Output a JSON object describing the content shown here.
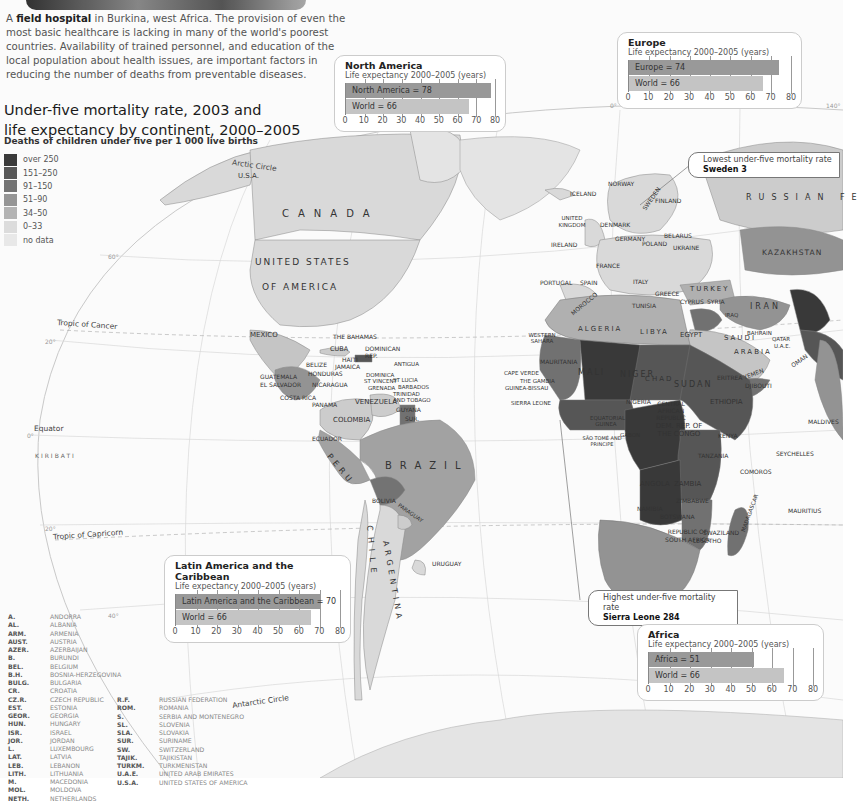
{
  "caption": {
    "bold": "field hospital",
    "prefix": "A ",
    "rest": " in Burkina, west Africa. The provision of even the most basic healthcare is lacking in many of the world's poorest countries. Availability of trained personnel, and education of the local population about health issues, are important factors in reducing the number of deaths from preventable diseases."
  },
  "title": {
    "line1": "Under-five mortality rate, 2003 and",
    "line2": "life expectancy by continent, 2000–2005",
    "subtitle": "Deaths of children under five per 1 000 live births"
  },
  "legend": [
    {
      "label": "over 250",
      "color": "#3a3a3a"
    },
    {
      "label": "151–250",
      "color": "#575757"
    },
    {
      "label": "91–150",
      "color": "#737373"
    },
    {
      "label": "51–90",
      "color": "#959595"
    },
    {
      "label": "34–50",
      "color": "#b3b3b3"
    },
    {
      "label": "0–33",
      "color": "#dcdcdc"
    },
    {
      "label": "no data",
      "color": "#e8e8e8"
    }
  ],
  "callouts": {
    "lowest": {
      "label": "Lowest under-five mortality rate",
      "value": "Sweden 3"
    },
    "highest": {
      "label": "Highest under-five mortality rate",
      "value": "Sierra Leone 284"
    }
  },
  "line_labels": {
    "arctic": "Arctic Circle",
    "cancer": "Tropic of Cancer",
    "equator": "Equator",
    "capricorn": "Tropic of Capricorn",
    "antarctic": "Antarctic Circle",
    "deg80": "80°",
    "deg60": "60°",
    "deg20n": "20°",
    "deg0": "0°",
    "deg20s": "20°",
    "deg40": "40°",
    "deg140": "140°",
    "deg0lon": "0°"
  },
  "map_labels": {
    "canada": "CANADA",
    "usa1": "UNITED STATES",
    "usa2": "OF AMERICA",
    "usa_ak": "U.S.A.",
    "mexico": "MEXICO",
    "brazil": "BRAZIL",
    "peru": "PERU",
    "chile": "CHILE",
    "argentina": "ARGENTINA",
    "bolivia": "BOLIVIA",
    "paraguay": "PARAGUAY",
    "uruguay": "URUGUAY",
    "colombia": "COLOMBIA",
    "venezuela": "VENEZUELA",
    "ecuador": "ECUADOR",
    "guyana": "GUYANA",
    "sur": "SUR.",
    "cuba": "CUBA",
    "bahamas": "THE BAHAMAS",
    "dominican": "DOMINICAN REP.",
    "haiti": "HAITI",
    "jamaica": "JAMAICA",
    "belize": "BELIZE",
    "honduras": "HONDURAS",
    "guatemala": "GUATEMALA",
    "elsalvador": "EL SALVADOR",
    "nicaragua": "NICARAGUA",
    "costarica": "COSTA RICA",
    "panama": "PANAMA",
    "antigua": "ANTIGUA",
    "dominica": "DOMINICA",
    "stvincent": "ST VINCENT",
    "grenada": "GRENADA",
    "stlucia": "ST LUCIA",
    "barbados": "BARBADOS",
    "trinidad": "TRINIDAD AND TOBAGO",
    "kiribati": "KIRIBATI",
    "iceland": "ICELAND",
    "norway": "NORWAY",
    "sweden": "SWEDEN",
    "finland": "FINLAND",
    "uk": "UNITED KINGDOM",
    "ireland": "IRELAND",
    "denmark": "DENMARK",
    "germany": "GERMANY",
    "poland": "POLAND",
    "france": "FRANCE",
    "spain": "SPAIN",
    "portugal": "PORTUGAL",
    "italy": "ITALY",
    "greece": "GREECE",
    "ukraine": "UKRAINE",
    "belarus": "BELARUS",
    "turkey": "TURKEY",
    "russia": "RUSSIAN FE",
    "kazakhstan": "KAZAKHSTAN",
    "iran": "IRAN",
    "iraq": "IRAQ",
    "saudi": "SAUDI",
    "arabia": "ARABIA",
    "yemen": "YEMEN",
    "oman": "OMAN",
    "syria": "SYRIA",
    "cyprus": "CYPRUS",
    "tunisia": "TUNISIA",
    "morocco": "MOROCCO",
    "algeria": "ALGERIA",
    "libya": "LIBYA",
    "egypt": "EGYPT",
    "westsahara": "WESTERN SAHARA",
    "mauritania": "MAURITANIA",
    "mali": "MALI",
    "niger": "NIGER",
    "chad": "CHAD",
    "sudan": "SUDAN",
    "ethiopia": "ETHIOPIA",
    "eritrea": "ERITREA",
    "djibouti": "DJIBOUTI",
    "nigeria": "NIGERIA",
    "car": "CENTRAL AFRICAN REPUBLIC",
    "drc": "DEM. REP. OF THE CONGO",
    "kenya": "KENYA",
    "tanzania": "TANZANIA",
    "angola": "ANGOLA",
    "zambia": "ZAMBIA",
    "zimbabwe": "ZIMBABWE",
    "namibia": "NAMIBIA",
    "botswana": "BOTSWANA",
    "southafrica": "REPUBLIC OF SOUTH AFRICA",
    "lesotho": "LESOTHO",
    "swaziland": "SWAZILAND",
    "madagascar": "MADAGASCAR",
    "comoros": "COMOROS",
    "seychelles": "SEYCHELLES",
    "mauritius": "MAURITIUS",
    "maldives": "MALDIVES",
    "capeverde": "CAPE VERDE",
    "gambia": "THE GAMBIA",
    "guineabissau": "GUINEA-BISSAU",
    "sierraleone": "SIERRA LEONE",
    "eqguinea": "EQUATORIAL GUINEA",
    "saotome": "SÃO TOMÉ AND PRINCIPE",
    "gabon": "GABON",
    "bahrain": "BAHRAIN",
    "qatar": "QATAR",
    "uae": "U.A.E."
  },
  "abbreviations": {
    "col1": [
      [
        "A.",
        "ANDORRA"
      ],
      [
        "AL.",
        "ALBANIA"
      ],
      [
        "ARM.",
        "ARMENIA"
      ],
      [
        "AUST.",
        "AUSTRIA"
      ],
      [
        "AZER.",
        "AZERBAIJAN"
      ],
      [
        "B.",
        "BURUNDI"
      ],
      [
        "BEL.",
        "BELGIUM"
      ],
      [
        "B.H.",
        "BOSNIA-HERZEGOVINA"
      ],
      [
        "BULG.",
        "BULGARIA"
      ],
      [
        "CR.",
        "CROATIA"
      ],
      [
        "CZ.R.",
        "CZECH REPUBLIC"
      ],
      [
        "EST.",
        "ESTONIA"
      ],
      [
        "GEOR.",
        "GEORGIA"
      ],
      [
        "HUN.",
        "HUNGARY"
      ],
      [
        "ISR.",
        "ISRAEL"
      ],
      [
        "JOR.",
        "JORDAN"
      ],
      [
        "L.",
        "LUXEMBOURG"
      ],
      [
        "LAT.",
        "LATVIA"
      ],
      [
        "LEB.",
        "LEBANON"
      ],
      [
        "LITH.",
        "LITHUANIA"
      ],
      [
        "M.",
        "MACEDONIA"
      ],
      [
        "MOL.",
        "MOLDOVA"
      ],
      [
        "NETH.",
        "NETHERLANDS"
      ]
    ],
    "col2": [
      [
        "R.F.",
        "RUSSIAN FEDERATION"
      ],
      [
        "ROM.",
        "ROMANIA"
      ],
      [
        "S.",
        "SERBIA AND MONTENEGRO"
      ],
      [
        "SL.",
        "SLOVENIA"
      ],
      [
        "SLA.",
        "SLOVAKIA"
      ],
      [
        "SUR.",
        "SURINAME"
      ],
      [
        "SW.",
        "SWITZERLAND"
      ],
      [
        "TAJIK.",
        "TAJIKISTAN"
      ],
      [
        "TURKM.",
        "TURKMENISTAN"
      ],
      [
        "U.A.E.",
        "UNITED ARAB EMIRATES"
      ],
      [
        "U.S.A.",
        "UNITED STATES OF AMERICA"
      ]
    ]
  },
  "chart_data": [
    {
      "type": "bar",
      "title": "North America",
      "subtitle": "Life expectancy 2000–2005 (years)",
      "categories": [
        "North America",
        "World"
      ],
      "values": [
        78,
        66
      ],
      "bar_labels": [
        "North America = 78",
        "World = 66"
      ],
      "xlim": [
        0,
        80
      ],
      "ticks": [
        0,
        10,
        20,
        30,
        40,
        50,
        60,
        70,
        80
      ],
      "orientation": "horizontal",
      "grid": true
    },
    {
      "type": "bar",
      "title": "Europe",
      "subtitle": "Life expectancy 2000–2005 (years)",
      "categories": [
        "Europe",
        "World"
      ],
      "values": [
        74,
        66
      ],
      "bar_labels": [
        "Europe = 74",
        "World = 66"
      ],
      "xlim": [
        0,
        80
      ],
      "ticks": [
        0,
        10,
        20,
        30,
        40,
        50,
        60,
        70,
        80
      ],
      "orientation": "horizontal",
      "grid": true
    },
    {
      "type": "bar",
      "title": "Latin America and the Caribbean",
      "subtitle": "Life expectancy 2000–2005 (years)",
      "categories": [
        "Latin America and the Caribbean",
        "World"
      ],
      "values": [
        70,
        66
      ],
      "bar_labels": [
        "Latin America and the Caribbean = 70",
        "World = 66"
      ],
      "xlim": [
        0,
        80
      ],
      "ticks": [
        0,
        10,
        20,
        30,
        40,
        50,
        60,
        70,
        80
      ],
      "orientation": "horizontal",
      "grid": true
    },
    {
      "type": "bar",
      "title": "Africa",
      "subtitle": "Life expectancy 2000–2005 (years)",
      "categories": [
        "Africa",
        "World"
      ],
      "values": [
        51,
        66
      ],
      "bar_labels": [
        "Africa = 51",
        "World = 66"
      ],
      "xlim": [
        0,
        80
      ],
      "ticks": [
        0,
        10,
        20,
        30,
        40,
        50,
        60,
        70,
        80
      ],
      "orientation": "horizontal",
      "grid": true
    }
  ]
}
